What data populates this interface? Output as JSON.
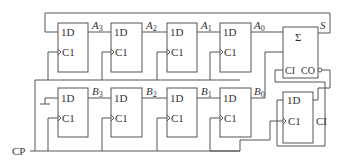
{
  "diagram": {
    "type": "serial adder circuit",
    "top_register": {
      "flip_flops": [
        {
          "input_label": "1D",
          "clock_label": "C1",
          "output": "A",
          "output_sub": "3"
        },
        {
          "input_label": "1D",
          "clock_label": "C1",
          "output": "A",
          "output_sub": "2"
        },
        {
          "input_label": "1D",
          "clock_label": "C1",
          "output": "A",
          "output_sub": "1"
        },
        {
          "input_label": "1D",
          "clock_label": "C1",
          "output": "A",
          "output_sub": "0"
        }
      ]
    },
    "bottom_register": {
      "flip_flops": [
        {
          "input_label": "1D",
          "clock_label": "C1",
          "output": "B",
          "output_sub": "3"
        },
        {
          "input_label": "1D",
          "clock_label": "C1",
          "output": "B",
          "output_sub": "2"
        },
        {
          "input_label": "1D",
          "clock_label": "C1",
          "output": "B",
          "output_sub": "1"
        },
        {
          "input_label": "1D",
          "clock_label": "C1",
          "output": "B",
          "output_sub": "0"
        }
      ]
    },
    "adder": {
      "symbol": "Σ",
      "carry_in_label": "CI",
      "carry_out_label": "CO",
      "sum_output": "S"
    },
    "carry_ff": {
      "input_label": "1D",
      "clock_label": "C1",
      "output_label": "CI"
    },
    "clock_input": "CP"
  }
}
